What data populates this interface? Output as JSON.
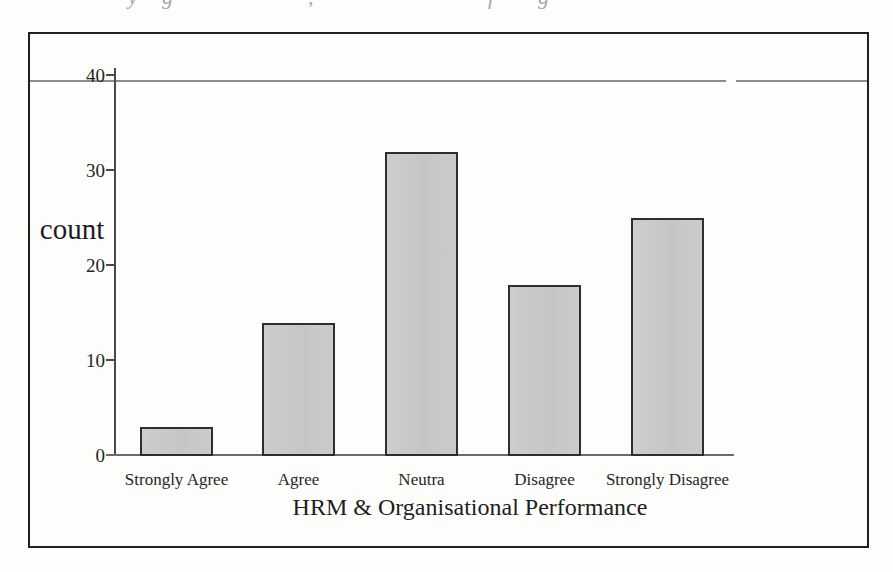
{
  "page": {
    "top_cropped_text_fragments": [
      {
        "glyph": "y",
        "x": 128
      },
      {
        "glyph": "g",
        "x": 162
      },
      {
        "glyph": ",",
        "x": 308
      },
      {
        "glyph": "f",
        "x": 488
      },
      {
        "glyph": "g",
        "x": 538
      }
    ]
  },
  "chart_data": {
    "type": "bar",
    "title": "",
    "xlabel": "HRM & Organisational Performance",
    "ylabel": "count",
    "categories": [
      "Strongly Agree",
      "Agree",
      "Neutra",
      "Disagree",
      "Strongly Disagree"
    ],
    "values": [
      3,
      14,
      32,
      18,
      25
    ],
    "ylim": [
      0,
      40
    ],
    "yticks": [
      0,
      10,
      20,
      30,
      40
    ],
    "grid": false,
    "legend": "none",
    "gridline_at_top_value": 40,
    "colors": {
      "bar_fill": "#c8c8c8",
      "bar_border": "#2e2e2e",
      "frame_border": "#1f1f1f",
      "axis": "#4a4a4a",
      "gridline": "#8d8d8d",
      "background": "#fdfdfc",
      "text": "#222222"
    }
  }
}
